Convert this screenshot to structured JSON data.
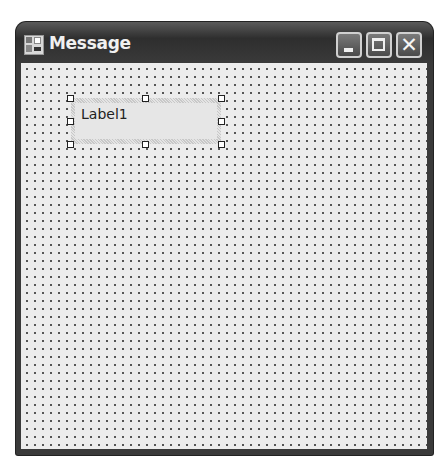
{
  "window": {
    "title": "Message",
    "icon": "form-icon",
    "buttons": {
      "minimize": "minimize-icon",
      "maximize": "maximize-icon",
      "close": "close-icon"
    }
  },
  "designer": {
    "grid": "dotted",
    "label_control": {
      "text": "Label1",
      "selected": true
    }
  }
}
